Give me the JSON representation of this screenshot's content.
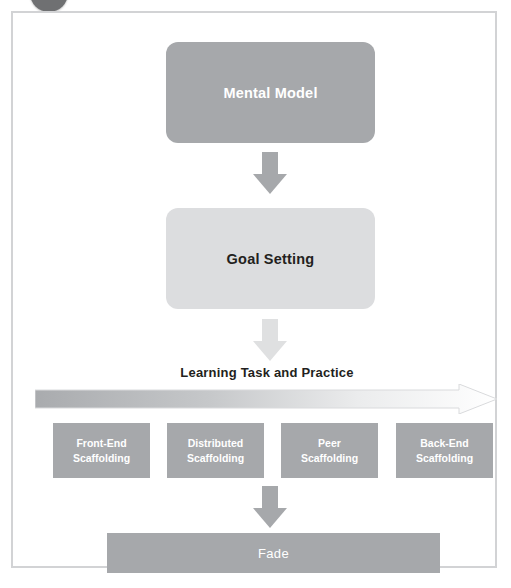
{
  "figure": {
    "badge": "step-badge-circle",
    "frame_border_color": "#d2d3d5",
    "nodes": {
      "mental_model": "Mental Model",
      "goal_setting": "Goal Setting",
      "practice_label": "Learning Task and Practice",
      "fade": "Fade"
    },
    "scaffolding": [
      {
        "line1": "Front-End",
        "line2": "Scaffolding"
      },
      {
        "line1": "Distributed",
        "line2": "Scaffolding"
      },
      {
        "line1": "Peer",
        "line2": "Scaffolding"
      },
      {
        "line1": "Back-End",
        "line2": "Scaffolding"
      }
    ],
    "colors": {
      "dark_gray": "#a6a8ab",
      "light_gray": "#dcdddf",
      "text_dark": "#231f20",
      "text_light": "#ffffff",
      "badge": "#6f7072"
    }
  }
}
